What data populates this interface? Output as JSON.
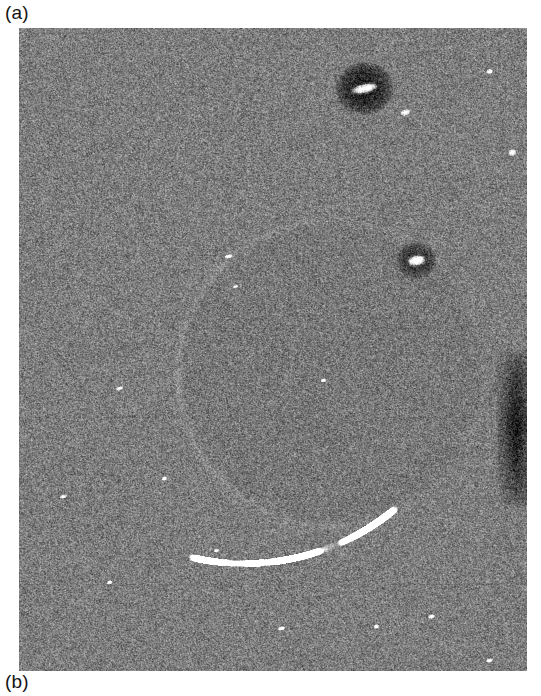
{
  "figure": {
    "panel_a_label": "(a)",
    "panel_b_label": "(b)"
  },
  "image": {
    "kind": "sar-speckle-image",
    "x": 19,
    "y": 28,
    "width": 508,
    "height": 643,
    "background_gray": "#7d7d7d",
    "mean_level": 125,
    "speckle_contrast": 62,
    "features": {
      "circle": {
        "name": "faint-circular-boundary",
        "cx": 311,
        "cy": 345,
        "r": 152,
        "edge_brightness": 18,
        "interior_tint": -5
      },
      "bright_targets": [
        {
          "name": "bright-target-top",
          "cx": 345,
          "cy": 60,
          "w": 26,
          "h": 9,
          "angle": -12,
          "halo_w": 58,
          "halo_h": 54,
          "halo_level": -95
        },
        {
          "name": "bright-target-middle",
          "cx": 397,
          "cy": 232,
          "w": 17,
          "h": 10,
          "angle": -10,
          "halo_w": 40,
          "halo_h": 38,
          "halo_level": -70
        }
      ],
      "bright_arc": {
        "name": "bright-curved-scatterer",
        "cx": 225,
        "cy": 300,
        "r": 235,
        "start_deg": 50,
        "end_deg": 103,
        "brightness": 125,
        "thickness": 4
      },
      "dark_band": {
        "name": "dark-vertical-band-right",
        "x": 486,
        "y": 320,
        "w": 22,
        "h": 160,
        "level": -105
      },
      "speckles": [
        {
          "cx": 386,
          "cy": 84,
          "w": 10,
          "h": 6
        },
        {
          "cx": 493,
          "cy": 124,
          "w": 8,
          "h": 7
        },
        {
          "cx": 470,
          "cy": 43,
          "w": 7,
          "h": 5
        },
        {
          "cx": 209,
          "cy": 228,
          "w": 8,
          "h": 4
        },
        {
          "cx": 100,
          "cy": 360,
          "w": 7,
          "h": 4
        },
        {
          "cx": 44,
          "cy": 468,
          "w": 7,
          "h": 4
        },
        {
          "cx": 145,
          "cy": 450,
          "w": 6,
          "h": 4
        },
        {
          "cx": 262,
          "cy": 600,
          "w": 8,
          "h": 4
        },
        {
          "cx": 357,
          "cy": 598,
          "w": 6,
          "h": 4
        },
        {
          "cx": 412,
          "cy": 588,
          "w": 7,
          "h": 4
        },
        {
          "cx": 90,
          "cy": 554,
          "w": 6,
          "h": 4
        },
        {
          "cx": 470,
          "cy": 632,
          "w": 7,
          "h": 4
        },
        {
          "cx": 197,
          "cy": 522,
          "w": 6,
          "h": 4
        },
        {
          "cx": 304,
          "cy": 352,
          "w": 6,
          "h": 4
        },
        {
          "cx": 216,
          "cy": 258,
          "w": 6,
          "h": 3
        }
      ]
    }
  }
}
